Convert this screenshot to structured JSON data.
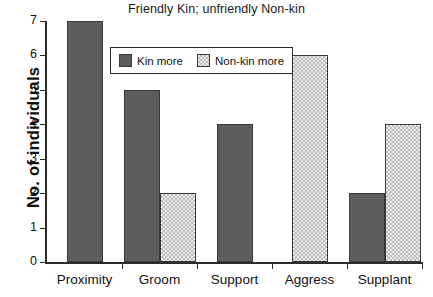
{
  "chart_data": {
    "type": "bar",
    "title": "Friendly Kin; unfriendly Non-kin",
    "xlabel": "",
    "ylabel": "No. of individuals",
    "ylim": [
      0,
      7
    ],
    "yticks": [
      0,
      1,
      2,
      3,
      4,
      5,
      6,
      7
    ],
    "ytick_labels": [
      "0",
      "1",
      "2",
      "3",
      "4",
      "5",
      "6",
      "7"
    ],
    "grid": false,
    "legend_position": "upper center",
    "categories": [
      "Proximity",
      "Groom",
      "Support",
      "Aggress",
      "Supplant"
    ],
    "series": [
      {
        "name": "Kin more",
        "color": "#5d5d5d",
        "values": [
          7,
          5,
          4,
          null,
          2
        ]
      },
      {
        "name": "Non-kin more",
        "color": "#e9e9e9",
        "values": [
          null,
          2,
          null,
          6,
          4
        ]
      }
    ]
  },
  "legend": {
    "entries": [
      {
        "label": "Kin more"
      },
      {
        "label": "Non-kin more"
      }
    ]
  },
  "colors": {
    "kin_fill": "#5d5d5d",
    "nonkin_fill": "#e9e9e9",
    "nonkin_hatch": "#bdbdbd",
    "axis": "#2b2b2b",
    "text": "#111111",
    "background": "#ffffff"
  }
}
